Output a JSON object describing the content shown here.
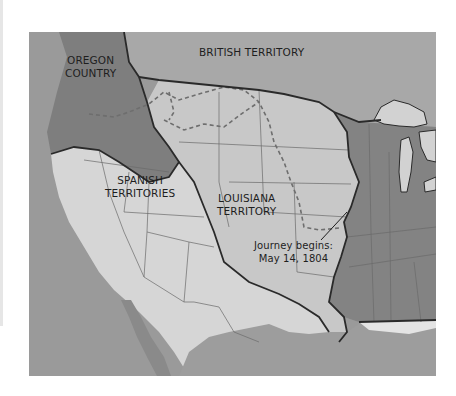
{
  "map": {
    "title": "Louisiana Purchase and surrounding territories",
    "regions": [
      {
        "id": "oregon",
        "label_lines": [
          "OREGON",
          "COUNTRY"
        ],
        "shade": "dark",
        "color": "#7e7e7e"
      },
      {
        "id": "british",
        "label_lines": [
          "BRITISH TERRITORY"
        ],
        "shade": "medium",
        "color": "#a8a8a8"
      },
      {
        "id": "spanish",
        "label_lines": [
          "SPANISH",
          "TERRITORIES"
        ],
        "shade": "light",
        "color": "#d6d6d6"
      },
      {
        "id": "louisiana",
        "label_lines": [
          "LOUISIANA",
          "TERRITORY"
        ],
        "shade": "light-medium",
        "color": "#c8c8c8"
      },
      {
        "id": "united-states",
        "label_lines": [],
        "shade": "dark",
        "color": "#838383"
      }
    ],
    "annotation": {
      "line1": "Journey begins:",
      "line2": "May 14, 1804"
    },
    "colors": {
      "ocean": "#9a9a9a",
      "great_lakes": "#d2d2d2",
      "border": "#2a2a2a",
      "route_dashed": "#6e6e6e",
      "state_lines": "#6a6a6a",
      "label_text": "#1e1e1e"
    }
  }
}
